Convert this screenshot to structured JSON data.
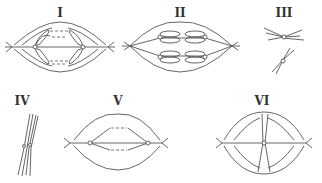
{
  "figure": {
    "panels": [
      {
        "label": "I",
        "description": "anaphase-like spindle with chromosomes moving to poles"
      },
      {
        "label": "II",
        "description": "metaphase-like spindle with chromosome pairs aligned"
      },
      {
        "label": "III",
        "description": "two separate X-shaped chromosomes"
      },
      {
        "label": "IV",
        "description": "tightly paired twisted chromosomes"
      },
      {
        "label": "V",
        "description": "spindle with chromosomes connected by dashed lines"
      },
      {
        "label": "VI",
        "description": "spindle with single chromosome at equator"
      }
    ]
  }
}
